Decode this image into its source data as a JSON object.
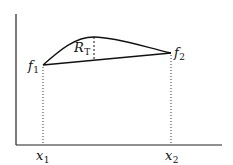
{
  "diagram": {
    "axes": {
      "origin": [
        16,
        145
      ],
      "y_top": 14,
      "x_right": 222,
      "color": "#222222"
    },
    "points": {
      "f1": {
        "x": 43,
        "y": 65
      },
      "f2": {
        "x": 171,
        "y": 53
      },
      "peak": {
        "x": 94,
        "y": 37
      }
    },
    "labels": {
      "f1": {
        "base": "f",
        "sub": "1"
      },
      "f2": {
        "base": "f",
        "sub": "2"
      },
      "rt": {
        "base": "R",
        "sub": "T"
      },
      "x1": {
        "base": "x",
        "sub": "1"
      },
      "x2": {
        "base": "x",
        "sub": "2"
      }
    }
  }
}
